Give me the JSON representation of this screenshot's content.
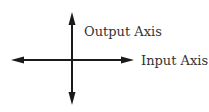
{
  "diagram": {
    "type": "coordinate-axes",
    "labels": {
      "vertical": "Output Axis",
      "horizontal": "Input Axis"
    },
    "colors": {
      "axis": "#1a1a1a",
      "text": "#333333",
      "background": "#ffffff"
    }
  }
}
